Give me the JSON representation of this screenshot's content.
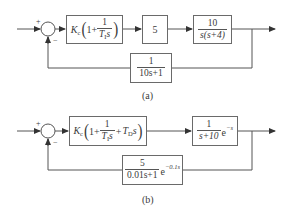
{
  "diagram_a": {
    "caption": "(a)",
    "input_sign": "+",
    "feedback_sign": "−",
    "controller": {
      "gain": "K",
      "gain_sub": "c",
      "one": "1+",
      "num": "1",
      "den_T": "T",
      "den_sub": "I",
      "den_s": "s"
    },
    "gain_block": {
      "value": "5"
    },
    "plant": {
      "num": "10",
      "den": "s(s+4)"
    },
    "feedback": {
      "num": "1",
      "den": "10s+1"
    }
  },
  "diagram_b": {
    "caption": "(b)",
    "input_sign": "+",
    "feedback_sign": "−",
    "controller": {
      "gain": "K",
      "gain_sub": "c",
      "one": "1+",
      "num": "1",
      "den_T": "T",
      "den_sub": "I",
      "den_s": "s",
      "plus": "+",
      "td": "T",
      "td_sub": "D",
      "td_s": "s"
    },
    "plant": {
      "num": "1",
      "den": "s+10",
      "delay_base": "e",
      "delay_exp": "−s"
    },
    "feedback": {
      "num": "5",
      "den": "0.01s+1",
      "delay_base": "e",
      "delay_exp": "−0.1s"
    }
  }
}
